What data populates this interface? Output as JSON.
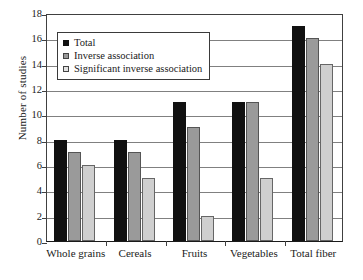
{
  "chart_data": {
    "type": "bar",
    "title": "",
    "xlabel": "",
    "ylabel": "Number of studies",
    "ylim": [
      0,
      18
    ],
    "ytick_step": 2,
    "yticks": [
      0,
      2,
      4,
      6,
      8,
      10,
      12,
      14,
      16,
      18
    ],
    "ytick_labels": [
      "0",
      "2",
      "4",
      "6",
      "8",
      "10",
      "12",
      "14",
      "16",
      "18"
    ],
    "grid": true,
    "grid_axis": "y",
    "legend_position": "upper left",
    "categories": [
      "Whole grains",
      "Cereals",
      "Fruits",
      "Vegetables",
      "Total fiber"
    ],
    "series": [
      {
        "name": "Total",
        "color": "#111111",
        "values": [
          8,
          8,
          11,
          11,
          17
        ]
      },
      {
        "name": "Inverse association",
        "color": "#9a9a9a",
        "values": [
          7,
          7,
          9,
          11,
          16
        ]
      },
      {
        "name": "Significant inverse association",
        "color": "#cfcfcf",
        "values": [
          6,
          5,
          2,
          5,
          14
        ]
      }
    ]
  },
  "colors": {
    "background": "#ffffff",
    "axis": "#1a1a1a",
    "gridline": "#808080",
    "series_total": "#111111",
    "series_inverse": "#9a9a9a",
    "series_significant": "#cfcfcf"
  }
}
